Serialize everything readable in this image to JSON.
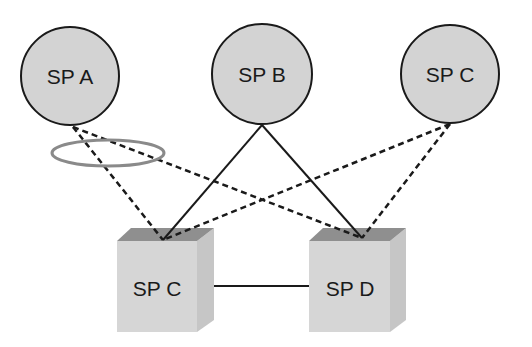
{
  "diagram": {
    "colors": {
      "node_fill": "#d3d3d3",
      "node_stroke": "#1a1a1a",
      "box_front": "#d6d6d6",
      "box_top": "#8f8f8f",
      "box_side": "#c4c4c4",
      "link": "#1a1a1a",
      "highlight_ellipse": "#8a8a8a"
    },
    "circle_nodes": [
      {
        "id": "sp-a",
        "label": "SP A",
        "cx": 70,
        "cy": 76,
        "r": 49
      },
      {
        "id": "sp-b",
        "label": "SP B",
        "cx": 262,
        "cy": 74,
        "r": 50
      },
      {
        "id": "sp-c-top",
        "label": "SP C",
        "cx": 450,
        "cy": 74,
        "r": 49
      }
    ],
    "box_nodes": [
      {
        "id": "sp-c-box",
        "label": "SP C"
      },
      {
        "id": "sp-d-box",
        "label": "SP D"
      }
    ],
    "links": [
      {
        "from": "SP A",
        "to": "SP C (box)",
        "style": "dashed"
      },
      {
        "from": "SP A",
        "to": "SP D (box)",
        "style": "dashed"
      },
      {
        "from": "SP B",
        "to": "SP C (box)",
        "style": "solid"
      },
      {
        "from": "SP B",
        "to": "SP D (box)",
        "style": "solid"
      },
      {
        "from": "SP C",
        "to": "SP C (box)",
        "style": "dashed"
      },
      {
        "from": "SP C",
        "to": "SP D (box)",
        "style": "dashed"
      },
      {
        "from": "SP C (box)",
        "to": "SP D (box)",
        "style": "solid"
      }
    ],
    "annotations": [
      {
        "type": "ellipse",
        "description": "highlight around SP A's two dashed links"
      }
    ]
  }
}
